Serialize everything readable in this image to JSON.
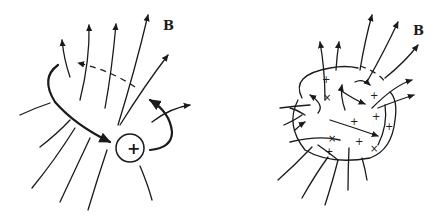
{
  "left_panel": {
    "field_label": "B",
    "charge_symbol": "+"
  },
  "right_panel": {
    "field_label": "B",
    "charge_symbol": "+"
  },
  "colors": {
    "ink": "#1a1a1a",
    "background": "#ffffff"
  }
}
